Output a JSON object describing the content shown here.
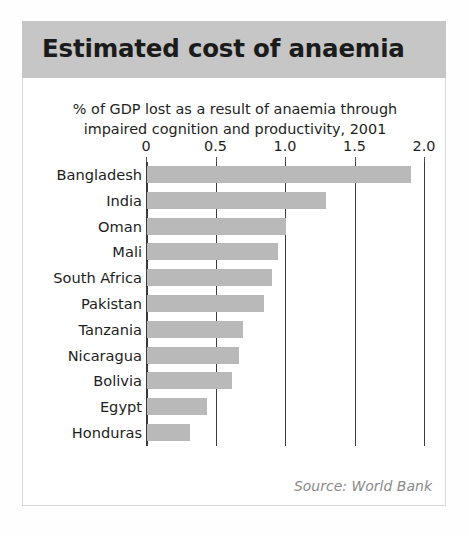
{
  "card": {
    "title": "Estimated cost of anaemia",
    "source_note": "Source: World Bank"
  },
  "colors": {
    "title_band": "#c6c6c6",
    "bar_fill": "#b9b9b9",
    "axis_line": "#3a3a3a",
    "text": "#1d1d1d",
    "source_text": "#8a8a8a",
    "card_background": "#ffffff"
  },
  "chart_data": {
    "type": "bar",
    "orientation": "horizontal",
    "title": "Estimated cost of anaemia",
    "subtitle_line_1": "% of GDP lost as a result of anaemia through",
    "subtitle_line_2": "impaired cognition and productivity, 2001",
    "xlabel": "",
    "ylabel": "",
    "xlim": [
      0,
      2.0
    ],
    "xticks": [
      0,
      0.5,
      1.0,
      1.5,
      2.0
    ],
    "xtick_labels": [
      "0",
      "0.5",
      "1.0",
      "1.5",
      "2.0"
    ],
    "grid": true,
    "grid_axis": "x",
    "legend": false,
    "categories": [
      "Bangladesh",
      "India",
      "Oman",
      "Mali",
      "South Africa",
      "Pakistan",
      "Tanzania",
      "Nicaragua",
      "Bolivia",
      "Egypt",
      "Honduras"
    ],
    "values": [
      1.9,
      1.29,
      1.0,
      0.94,
      0.9,
      0.84,
      0.69,
      0.66,
      0.61,
      0.43,
      0.31
    ],
    "units": "% of GDP",
    "year": 2001,
    "source": "World Bank"
  }
}
